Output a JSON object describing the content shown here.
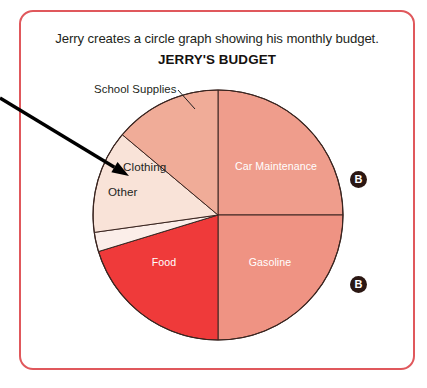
{
  "page": {
    "width": 427,
    "height": 388,
    "background": "#ffffff",
    "frame_color": "#e0585c"
  },
  "header": {
    "prompt": "Jerry creates a circle graph showing his monthly budget.",
    "chart_title": "JERRY'S BUDGET"
  },
  "annotations": {
    "callout_label": "School Supplies",
    "badge_1": "B",
    "badge_2": "B",
    "arrow_target": "Other",
    "arrow_start": {
      "x": 0,
      "y": 98
    },
    "arrow_end": {
      "x": 129,
      "y": 176
    }
  },
  "chart_data": {
    "type": "pie",
    "title": "JERRY'S BUDGET",
    "subtitle": "Jerry creates a circle graph showing his monthly budget.",
    "center": {
      "x": 218,
      "y": 215
    },
    "radius": 125,
    "start_angle_deg": 0,
    "direction": "clockwise",
    "legend": "none",
    "labels_inside": true,
    "categories": [
      "Car Maintenance",
      "Gasoline",
      "Food",
      "Other",
      "Clothing",
      "School Supplies"
    ],
    "values": [
      25,
      25,
      20.3,
      2.5,
      13.3,
      13.9
    ],
    "slices": [
      {
        "name": "Car Maintenance",
        "label": "Car Maintenance",
        "value": 25,
        "start_deg": 0,
        "end_deg": 90,
        "color": "#ef9d8c",
        "label_color": "#ffffff"
      },
      {
        "name": "Gasoline",
        "label": "Gasoline",
        "value": 25,
        "start_deg": 90,
        "end_deg": 180,
        "color": "#ef9383",
        "label_color": "#ffffff"
      },
      {
        "name": "Food",
        "label": "Food",
        "value": 20.3,
        "start_deg": 180,
        "end_deg": 253,
        "color": "#ef3a3a",
        "label_color": "#ffffff"
      },
      {
        "name": "Other",
        "label": "Other",
        "value": 2.5,
        "start_deg": 253,
        "end_deg": 262,
        "color": "#fbeee9",
        "label_color": "#231f20"
      },
      {
        "name": "Clothing",
        "label": "Clothing",
        "value": 13.3,
        "start_deg": 262,
        "end_deg": 310,
        "color": "#f9e3d8",
        "label_color": "#231f20"
      },
      {
        "name": "School Supplies",
        "label": "School Supplies",
        "value": 13.9,
        "start_deg": 310,
        "end_deg": 360,
        "color": "#f0ac98",
        "label_color": "#231f20"
      }
    ]
  }
}
